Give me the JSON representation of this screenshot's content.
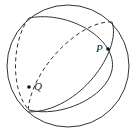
{
  "diagram": {
    "type": "sphere-great-circles",
    "labels": {
      "p": "P",
      "q": "Q"
    },
    "colors": {
      "stroke": "#333333",
      "background": "#ffffff"
    }
  }
}
